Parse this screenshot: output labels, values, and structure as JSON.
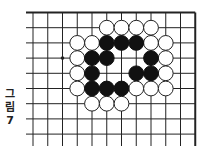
{
  "figure": {
    "caption_chars": [
      "그",
      "림",
      "7"
    ],
    "colors": {
      "line": "#222222",
      "black_stone": "#111111",
      "white_stone": "#ffffff",
      "stone_outline": "#222222"
    },
    "grid": {
      "x0": 33,
      "dx": 14.75,
      "cols": 12,
      "y0": 12.5,
      "dy": 15.2,
      "rows": 9,
      "line_left": 26,
      "line_bottom": 146
    },
    "stone_radius": 7.4,
    "black_stones": [
      [
        5,
        2
      ],
      [
        6,
        2
      ],
      [
        7,
        2
      ],
      [
        4,
        3
      ],
      [
        5,
        3
      ],
      [
        8,
        3
      ],
      [
        4,
        4
      ],
      [
        7,
        4
      ],
      [
        8,
        4
      ],
      [
        4,
        5
      ],
      [
        5,
        5
      ],
      [
        6,
        5
      ]
    ],
    "white_stones": [
      [
        5,
        1
      ],
      [
        6,
        1
      ],
      [
        7,
        1
      ],
      [
        8,
        1
      ],
      [
        3,
        2
      ],
      [
        4,
        2
      ],
      [
        8,
        2
      ],
      [
        9,
        2
      ],
      [
        3,
        3
      ],
      [
        9,
        3
      ],
      [
        3,
        4
      ],
      [
        9,
        4
      ],
      [
        3,
        5
      ],
      [
        7,
        5
      ],
      [
        8,
        5
      ],
      [
        9,
        5
      ],
      [
        4,
        6
      ],
      [
        5,
        6
      ],
      [
        6,
        6
      ]
    ],
    "marks": [
      {
        "type": "dot",
        "col": 2,
        "row": 3
      }
    ]
  }
}
